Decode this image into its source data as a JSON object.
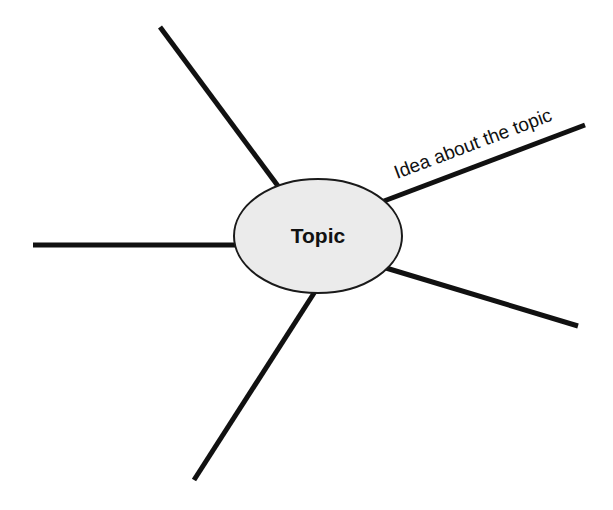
{
  "diagram": {
    "type": "spider-map",
    "center": {
      "label": "Topic",
      "shape": "ellipse",
      "fill": "#ebebeb",
      "stroke": "#1a1a1a"
    },
    "spokes": [
      {
        "position": "upper-left",
        "label": ""
      },
      {
        "position": "left",
        "label": ""
      },
      {
        "position": "lower-left",
        "label": ""
      },
      {
        "position": "lower-right",
        "label": ""
      },
      {
        "position": "upper-right",
        "label": "Idea about the topic"
      }
    ],
    "line_color": "#111111",
    "background": "#ffffff"
  }
}
